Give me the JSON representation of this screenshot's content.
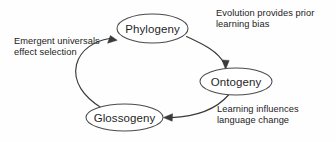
{
  "diagram": {
    "background_color": "#fefefe",
    "stroke_color": "#3a3a3a",
    "text_color": "#232323",
    "nodes": [
      {
        "id": "phylogeny",
        "label": "Phylogeny",
        "cx": 152.5,
        "cy": 28.5,
        "rx": 35.5,
        "ry": 14.5
      },
      {
        "id": "ontogeny",
        "label": "Ontogeny",
        "cx": 236.0,
        "cy": 81.5,
        "rx": 36.0,
        "ry": 13.5
      },
      {
        "id": "glossogeny",
        "label": "Glossogeny",
        "cx": 124.5,
        "cy": 117.5,
        "rx": 38.5,
        "ry": 13.5
      }
    ],
    "edges": [
      {
        "id": "phylogeny-to-ontogeny",
        "from": "phylogeny",
        "to": "ontogeny",
        "label_lines": [
          "Evolution provides prior",
          "learning bias"
        ],
        "arrow_direction": "down"
      },
      {
        "id": "ontogeny-to-glossogeny",
        "from": "ontogeny",
        "to": "glossogeny",
        "label_lines": [
          "Learning influences",
          "language change"
        ],
        "arrow_direction": "left"
      },
      {
        "id": "glossogeny-to-phylogeny",
        "from": "glossogeny",
        "to": "phylogeny",
        "label_lines": [
          "Emergent universals",
          "effect selection"
        ],
        "arrow_direction": "up-right"
      }
    ],
    "annotations": {
      "evolution": {
        "line1": "Evolution provides prior",
        "line2": "learning bias"
      },
      "emergent": {
        "line1": "Emergent universals",
        "line2": "effect selection"
      },
      "learning": {
        "line1": "Learning influences",
        "line2": "language change"
      }
    }
  }
}
